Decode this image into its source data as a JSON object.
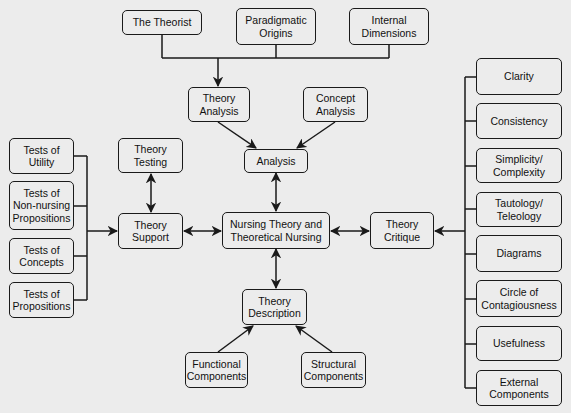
{
  "diagram": {
    "type": "concept-map",
    "center": "Nursing Theory and\nTheoretical Nursing",
    "nodes": {
      "theorist": "The Theorist",
      "paradigmatic": "Paradigmatic\nOrigins",
      "internal": "Internal\nDimensions",
      "theory_analysis": "Theory\nAnalysis",
      "concept_analysis": "Concept\nAnalysis",
      "analysis": "Analysis",
      "theory_testing": "Theory\nTesting",
      "theory_support": "Theory\nSupport",
      "center": "Nursing Theory and\nTheoretical Nursing",
      "theory_critique": "Theory\nCritique",
      "theory_description": "Theory\nDescription",
      "functional": "Functional\nComponents",
      "structural": "Structural\nComponents",
      "tests_utility": "Tests of\nUtility",
      "tests_nonnursing": "Tests of\nNon-nursing\nPropositions",
      "tests_concepts": "Tests of\nConcepts",
      "tests_propositions": "Tests of\nPropositions",
      "clarity": "Clarity",
      "consistency": "Consistency",
      "simplicity": "Simplicity/\nComplexity",
      "tautology": "Tautology/\nTeleology",
      "diagrams": "Diagrams",
      "circle": "Circle of\nContagiousness",
      "usefulness": "Usefulness",
      "external": "External\nComponents"
    },
    "edges": [
      {
        "from": [
          "The Theorist",
          "Paradigmatic Origins",
          "Internal Dimensions"
        ],
        "to": "Theory Analysis",
        "type": "merge-arrow"
      },
      {
        "from": "Theory Analysis",
        "to": "Analysis",
        "type": "arrow"
      },
      {
        "from": "Concept Analysis",
        "to": "Analysis",
        "type": "arrow"
      },
      {
        "from": "Analysis",
        "to": "Nursing Theory and Theoretical Nursing",
        "type": "bidirectional"
      },
      {
        "from": "Theory Testing",
        "to": "Theory Support",
        "type": "bidirectional"
      },
      {
        "from": "Theory Support",
        "to": "Nursing Theory and Theoretical Nursing",
        "type": "bidirectional"
      },
      {
        "from": "Nursing Theory and Theoretical Nursing",
        "to": "Theory Critique",
        "type": "bidirectional"
      },
      {
        "from": "Nursing Theory and Theoretical Nursing",
        "to": "Theory Description",
        "type": "bidirectional"
      },
      {
        "from": "Functional Components",
        "to": "Theory Description",
        "type": "arrow"
      },
      {
        "from": "Structural Components",
        "to": "Theory Description",
        "type": "arrow"
      },
      {
        "from": [
          "Tests of Utility",
          "Tests of Non-nursing Propositions",
          "Tests of Concepts",
          "Tests of Propositions"
        ],
        "to": "Theory Support",
        "type": "merge-arrow"
      },
      {
        "from": [
          "Clarity",
          "Consistency",
          "Simplicity/Complexity",
          "Tautology/Teleology",
          "Diagrams",
          "Circle of Contagiousness",
          "Usefulness",
          "External Components"
        ],
        "to": "Theory Critique",
        "type": "merge-arrow"
      }
    ],
    "colors": {
      "background": "#ececec",
      "stroke": "#1a1a1a",
      "text": "#111111"
    }
  }
}
